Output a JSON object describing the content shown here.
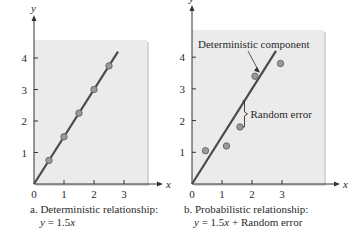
{
  "colors": {
    "panel_bg": "#ebebeb",
    "panel_shadow": "#d6d6d6",
    "line": "#4a4a4a",
    "point_fill": "#9a9a9a",
    "point_stroke": "#6a6a6a",
    "axis": "#333333",
    "text": "#2a2a2a"
  },
  "chart_data": [
    {
      "type": "scatter",
      "panel": "a",
      "title": "a. Deterministic relationship:",
      "subtitle": "y = 1.5x",
      "xlabel": "x",
      "ylabel": "y",
      "xlim": [
        0,
        3.7
      ],
      "ylim": [
        0,
        4.5
      ],
      "xticks": [
        0,
        1,
        2,
        3
      ],
      "yticks": [
        1,
        2,
        3,
        4
      ],
      "grid": false,
      "line": {
        "slope": 1.5,
        "intercept": 0,
        "x_range": [
          0,
          2.8
        ],
        "label": "y = 1.5x"
      },
      "points": [
        {
          "x": 0.5,
          "y": 0.75
        },
        {
          "x": 1.0,
          "y": 1.5
        },
        {
          "x": 1.5,
          "y": 2.25
        },
        {
          "x": 2.0,
          "y": 3.0
        },
        {
          "x": 2.5,
          "y": 3.75
        }
      ]
    },
    {
      "type": "scatter",
      "panel": "b",
      "title": "b. Probabilistic relationship:",
      "subtitle": "y = 1.5x + Random error",
      "xlabel": "x",
      "ylabel": "y",
      "xlim": [
        0,
        4.4
      ],
      "ylim": [
        0,
        4.8
      ],
      "xticks": [
        0,
        1,
        2,
        3
      ],
      "yticks": [
        1,
        2,
        3,
        4
      ],
      "grid": false,
      "line": {
        "slope": 1.5,
        "intercept": 0,
        "x_range": [
          0,
          2.8
        ],
        "label": "Deterministic component"
      },
      "points": [
        {
          "x": 0.45,
          "y": 1.05
        },
        {
          "x": 1.15,
          "y": 1.2
        },
        {
          "x": 1.6,
          "y": 1.8
        },
        {
          "x": 2.1,
          "y": 3.4
        },
        {
          "x": 2.95,
          "y": 3.8
        }
      ],
      "annotations": [
        {
          "text": "Deterministic component",
          "target": "line",
          "arrow": true
        },
        {
          "text": "Random error",
          "bracket": {
            "x": 1.75,
            "y_from": 1.8,
            "y_to": 2.62
          }
        }
      ]
    }
  ],
  "captions": {
    "a": {
      "line1": "a. Deterministic relationship:",
      "eq_lhs": "y",
      "eq_rhs": " = 1.5",
      "eq_var": "x"
    },
    "b": {
      "line1": "b. Probabilistic relationship:",
      "eq_lhs": "y",
      "eq_rhs": " = 1.5",
      "eq_var": "x",
      "eq_tail": " + Random error"
    }
  },
  "labels": {
    "deterministic_component": "Deterministic component",
    "random_error": "Random error"
  }
}
